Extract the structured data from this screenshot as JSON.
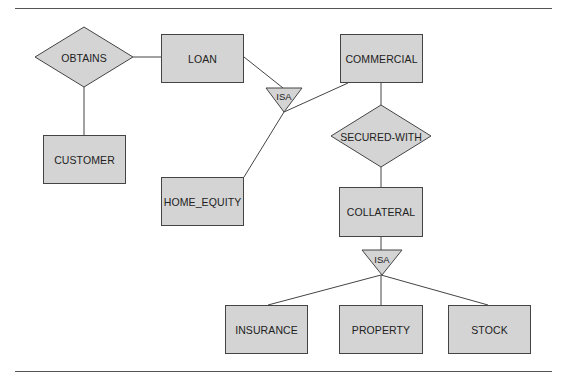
{
  "diagram": {
    "type": "ER diagram",
    "colors": {
      "fill": "#d4d4d4",
      "stroke": "#444444",
      "rule": "#555555"
    },
    "entities": [
      {
        "id": "loan",
        "label": "LOAN",
        "x": 161,
        "y": 34,
        "w": 83,
        "h": 49
      },
      {
        "id": "commercial",
        "label": "COMMERCIAL",
        "x": 340,
        "y": 34,
        "w": 83,
        "h": 49
      },
      {
        "id": "customer",
        "label": "CUSTOMER",
        "x": 43,
        "y": 135,
        "w": 83,
        "h": 49
      },
      {
        "id": "home_equity",
        "label": "HOME_EQUITY",
        "x": 161,
        "y": 177,
        "w": 83,
        "h": 49
      },
      {
        "id": "collateral",
        "label": "COLLATERAL",
        "x": 339,
        "y": 187,
        "w": 84,
        "h": 50
      },
      {
        "id": "insurance",
        "label": "INSURANCE",
        "x": 225,
        "y": 305,
        "w": 83,
        "h": 49
      },
      {
        "id": "property",
        "label": "PROPERTY",
        "x": 339,
        "y": 305,
        "w": 84,
        "h": 49
      },
      {
        "id": "stock",
        "label": "STOCK",
        "x": 448,
        "y": 305,
        "w": 83,
        "h": 49
      }
    ],
    "relationships": [
      {
        "id": "obtains",
        "label": "OBTAINS",
        "cx": 84,
        "cy": 57,
        "hw": 49,
        "hh": 30
      },
      {
        "id": "secured_with",
        "label": "SECURED-WITH",
        "cx": 381,
        "cy": 136,
        "hw": 50,
        "hh": 31
      }
    ],
    "isa": [
      {
        "id": "isa_loan",
        "label": "ISA",
        "cx": 284,
        "top": 88,
        "hw": 18,
        "apex": 112
      },
      {
        "id": "isa_collateral",
        "label": "ISA",
        "cx": 382,
        "top": 250,
        "hw": 20,
        "apex": 275
      }
    ],
    "connectors": [
      {
        "from": "obtains",
        "to": "loan"
      },
      {
        "from": "obtains",
        "to": "customer"
      },
      {
        "from": "loan",
        "to": "isa_loan"
      },
      {
        "from": "isa_loan",
        "to": "commercial"
      },
      {
        "from": "isa_loan",
        "to": "home_equity"
      },
      {
        "from": "commercial",
        "to": "secured_with"
      },
      {
        "from": "secured_with",
        "to": "collateral"
      },
      {
        "from": "collateral",
        "to": "isa_collateral"
      },
      {
        "from": "isa_collateral",
        "to": "insurance"
      },
      {
        "from": "isa_collateral",
        "to": "property"
      },
      {
        "from": "isa_collateral",
        "to": "stock"
      }
    ]
  },
  "labels": {
    "loan": "LOAN",
    "commercial": "COMMERCIAL",
    "customer": "CUSTOMER",
    "home_equity": "HOME_EQUITY",
    "collateral": "COLLATERAL",
    "insurance": "INSURANCE",
    "property": "PROPERTY",
    "stock": "STOCK",
    "obtains": "OBTAINS",
    "secured_with": "SECURED-WITH",
    "isa_loan": "ISA",
    "isa_collateral": "ISA"
  }
}
